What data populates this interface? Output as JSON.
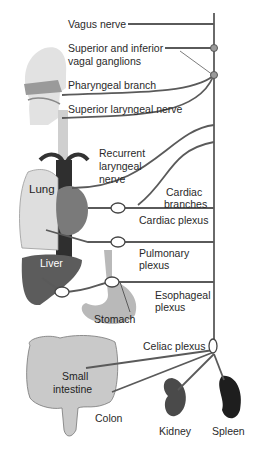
{
  "diagram": {
    "colors": {
      "nerve": "#5a5a5a",
      "organ_light": "#d9d9d9",
      "organ_mid": "#a0a0a0",
      "organ_dark": "#444444",
      "liver": "#5c5c5c",
      "spleen": "#1e1e1e",
      "kidney": "#4a4a4a",
      "text": "#2a2a2a"
    },
    "labels": {
      "vagus_nerve": "Vagus nerve",
      "ganglia_1": "Superior and inferior",
      "ganglia_2": "vagal ganglions",
      "pharyngeal": "Pharyngeal branch",
      "superior_laryngeal": "Superior laryngeal nerve",
      "recurrent_1": "Recurrent",
      "recurrent_2": "laryngeal",
      "recurrent_3": "nerve",
      "lung": "Lung",
      "cardiac_br_1": "Cardiac",
      "cardiac_br_2": "branches",
      "cardiac_plexus": "Cardiac plexus",
      "pulmonary_1": "Pulmonary",
      "pulmonary_2": "plexus",
      "liver": "Liver",
      "esophageal_1": "Esophageal",
      "esophageal_2": "plexus",
      "stomach": "Stomach",
      "celiac": "Celiac plexus",
      "small_int_1": "Small",
      "small_int_2": "intestine",
      "colon": "Colon",
      "kidney": "Kidney",
      "spleen": "Spleen"
    }
  }
}
